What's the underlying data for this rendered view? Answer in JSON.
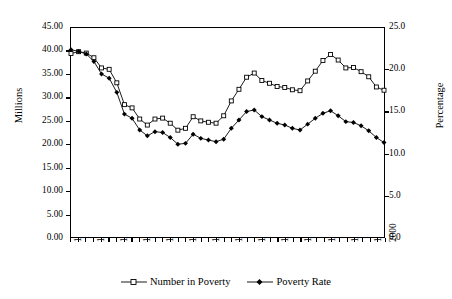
{
  "chart_data": {
    "type": "line",
    "title": "",
    "xlabel": "",
    "ylabel": "Millions",
    "y2label": "Percentage",
    "grid": false,
    "legend_position": "bottom-center",
    "ylim": [
      0,
      45
    ],
    "y2lim": [
      0,
      25
    ],
    "ytick_labels": [
      "45.00",
      "40.00",
      "35.00",
      "30.00",
      "25.00",
      "20.00",
      "15.00",
      "10.00",
      "5.00",
      "0.00"
    ],
    "ytick_values": [
      45,
      40,
      35,
      30,
      25,
      20,
      15,
      10,
      5,
      0
    ],
    "y2tick_labels": [
      "25.0",
      "20.0",
      "15.0",
      "10.0",
      "5.0",
      "0.0"
    ],
    "y2tick_values": [
      25,
      20,
      15,
      10,
      5,
      0
    ],
    "x": [
      1959,
      1960,
      1961,
      1962,
      1963,
      1964,
      1965,
      1966,
      1967,
      1968,
      1969,
      1970,
      1971,
      1972,
      1973,
      1974,
      1975,
      1976,
      1977,
      1978,
      1979,
      1980,
      1981,
      1982,
      1983,
      1984,
      1985,
      1986,
      1987,
      1988,
      1989,
      1990,
      1991,
      1992,
      1993,
      1994,
      1995,
      1996,
      1997,
      1998,
      1999,
      2000
    ],
    "xtick_labels": [
      "1959",
      "1962",
      "1965",
      "1968",
      "1971",
      "1974",
      "1977",
      "1980",
      "1983",
      "1986",
      "1989",
      "1992",
      "1995",
      "1998",
      "2000"
    ],
    "xtick_values": [
      1959,
      1962,
      1965,
      1968,
      1971,
      1974,
      1977,
      1980,
      1983,
      1986,
      1989,
      1992,
      1995,
      1998,
      2000
    ],
    "series": [
      {
        "name": "Number in Poverty",
        "axis": "left",
        "unit": "millions",
        "marker": "open-square",
        "color": "#000000",
        "values": [
          39.5,
          39.9,
          39.6,
          38.6,
          36.4,
          36.1,
          33.2,
          28.5,
          27.8,
          25.4,
          24.1,
          25.4,
          25.6,
          24.5,
          23.0,
          23.4,
          25.9,
          25.0,
          24.7,
          24.5,
          26.1,
          29.3,
          31.8,
          34.4,
          35.3,
          33.7,
          33.1,
          32.4,
          32.2,
          31.7,
          31.5,
          33.6,
          35.7,
          38.0,
          39.3,
          38.1,
          36.4,
          36.5,
          35.6,
          34.5,
          32.3,
          31.6
        ]
      },
      {
        "name": "Poverty Rate",
        "axis": "right",
        "unit": "percent",
        "marker": "filled-diamond",
        "color": "#000000",
        "values": [
          22.4,
          22.2,
          21.9,
          21.0,
          19.5,
          19.0,
          17.3,
          14.7,
          14.2,
          12.8,
          12.1,
          12.6,
          12.5,
          11.9,
          11.1,
          11.2,
          12.3,
          11.8,
          11.6,
          11.4,
          11.7,
          13.0,
          14.0,
          15.0,
          15.2,
          14.4,
          14.0,
          13.6,
          13.4,
          13.0,
          12.8,
          13.5,
          14.2,
          14.8,
          15.1,
          14.5,
          13.8,
          13.7,
          13.3,
          12.7,
          11.9,
          11.3
        ]
      }
    ]
  },
  "legend": {
    "items": [
      {
        "label": "Number in Poverty",
        "marker": "open-square"
      },
      {
        "label": "Poverty Rate",
        "marker": "filled-diamond"
      }
    ]
  },
  "axes": {
    "left_title": "Millions",
    "right_title": "Percentage"
  }
}
